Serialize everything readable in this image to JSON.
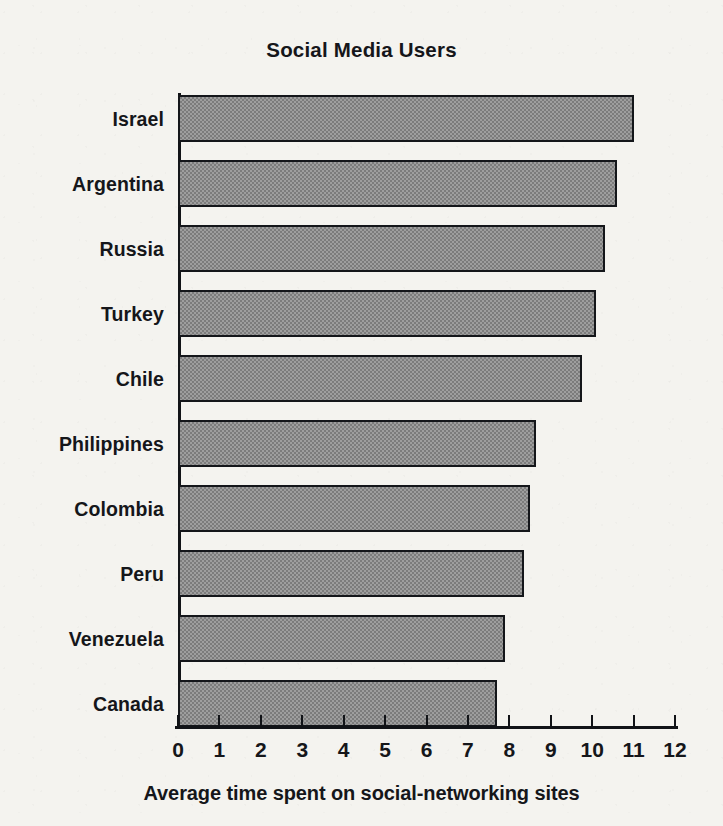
{
  "chart_data": {
    "type": "bar",
    "orientation": "horizontal",
    "title": "Social Media Users",
    "xlabel": "Average time spent on social-networking sites",
    "ylabel": "",
    "xlim": [
      0,
      12
    ],
    "xticks": [
      0,
      1,
      2,
      3,
      4,
      5,
      6,
      7,
      8,
      9,
      10,
      11,
      12
    ],
    "xtick_labels": [
      "0",
      "1",
      "2",
      "3",
      "4",
      "5",
      "6",
      "7",
      "8",
      "9",
      "10",
      "11",
      "12"
    ],
    "grid": false,
    "legend": null,
    "categories": [
      "Israel",
      "Argentina",
      "Russia",
      "Turkey",
      "Chile",
      "Philippines",
      "Colombia",
      "Peru",
      "Venezuela",
      "Canada"
    ],
    "values": [
      11.0,
      10.6,
      10.3,
      10.1,
      9.75,
      8.65,
      8.5,
      8.35,
      7.9,
      7.7
    ],
    "bars": [
      {
        "label": "Israel",
        "value": 11.0
      },
      {
        "label": "Argentina",
        "value": 10.6
      },
      {
        "label": "Russia",
        "value": 10.3
      },
      {
        "label": "Turkey",
        "value": 10.1
      },
      {
        "label": "Chile",
        "value": 9.75
      },
      {
        "label": "Philippines",
        "value": 8.65
      },
      {
        "label": "Colombia",
        "value": 8.5
      },
      {
        "label": "Peru",
        "value": 8.35
      },
      {
        "label": "Venezuela",
        "value": 7.9
      },
      {
        "label": "Canada",
        "value": 7.7
      }
    ],
    "colors": {
      "bar_fill": "#8d8d8d",
      "bar_border": "#14161a",
      "axis": "#111317",
      "text": "#15161a",
      "background": "#f4f3ef"
    }
  }
}
